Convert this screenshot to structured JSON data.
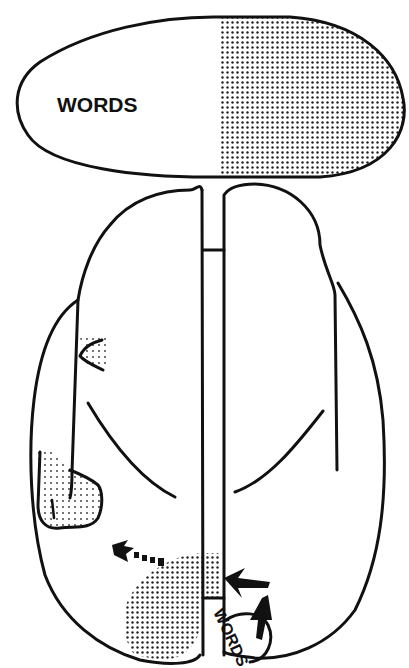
{
  "diagram": {
    "visual_field": {
      "left_label": "WORDS",
      "right_half": "stippled"
    },
    "brain": {
      "labels": {
        "occipital_label": "WORDS"
      },
      "regions": [
        {
          "name": "small-stippled-lesion-frontal",
          "fill": "stipple"
        },
        {
          "name": "stippled-lesion-temporal",
          "fill": "stipple"
        },
        {
          "name": "stippled-lesion-occipital",
          "fill": "stipple"
        }
      ],
      "arrows": [
        {
          "name": "dashed-arrow-left",
          "direction": "left-up"
        },
        {
          "name": "arrow-into-corpus-callosum",
          "direction": "left"
        },
        {
          "name": "arrow-up-from-words",
          "direction": "up"
        }
      ]
    },
    "colors": {
      "ink": "#111111",
      "background": "#ffffff"
    }
  }
}
